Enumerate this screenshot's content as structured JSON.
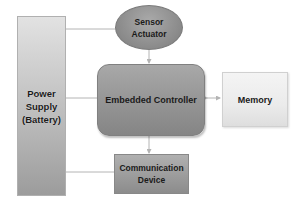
{
  "diagram": {
    "type": "block-diagram",
    "nodes": {
      "power_supply": {
        "line1": "Power",
        "line2": "Supply",
        "line3": "(Battery)"
      },
      "sensor_actuator": {
        "line1": "Sensor",
        "line2": "Actuator"
      },
      "embedded_controller": {
        "label": "Embedded Controller"
      },
      "memory": {
        "label": "Memory"
      },
      "communication_device": {
        "line1": "Communication",
        "line2": "Device"
      }
    },
    "edges": [
      {
        "from": "power_supply",
        "to": "sensor_actuator",
        "style": "line"
      },
      {
        "from": "power_supply",
        "to": "embedded_controller",
        "style": "line"
      },
      {
        "from": "power_supply",
        "to": "communication_device",
        "style": "line"
      },
      {
        "from": "sensor_actuator",
        "to": "embedded_controller",
        "style": "arrow"
      },
      {
        "from": "embedded_controller",
        "to": "memory",
        "style": "double-arrow"
      },
      {
        "from": "embedded_controller",
        "to": "communication_device",
        "style": "arrow"
      }
    ],
    "colors": {
      "line": "#b4b4b4",
      "dark_box": "#969696",
      "light_box": "#ececec"
    }
  }
}
